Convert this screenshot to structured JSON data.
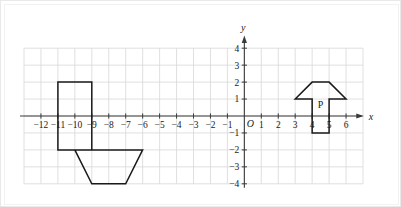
{
  "chart_data": {
    "type": "scatter",
    "title": "",
    "xlabel": "x",
    "ylabel": "y",
    "xlim": [
      -13,
      7
    ],
    "ylim": [
      -4.5,
      4.5
    ],
    "grid": true,
    "legend": null,
    "origin_label": "O",
    "x_ticks": [
      {
        "value": -12,
        "label": "−12"
      },
      {
        "value": -11,
        "label": "−11"
      },
      {
        "value": -10,
        "label": "−10"
      },
      {
        "value": -9,
        "label": "−9"
      },
      {
        "value": -8,
        "label": "−8"
      },
      {
        "value": -7,
        "label": "−7"
      },
      {
        "value": -6,
        "label": "−6"
      },
      {
        "value": -5,
        "label": "−5"
      },
      {
        "value": -4,
        "label": "−4"
      },
      {
        "value": -3,
        "label": "−3"
      },
      {
        "value": -2,
        "label": "−2"
      },
      {
        "value": -1,
        "label": "−1"
      },
      {
        "value": 1,
        "label": "1"
      },
      {
        "value": 2,
        "label": "2"
      },
      {
        "value": 3,
        "label": "3"
      },
      {
        "value": 4,
        "label": "4"
      },
      {
        "value": 5,
        "label": "5"
      },
      {
        "value": 6,
        "label": "6"
      }
    ],
    "y_ticks": [
      {
        "value": 4,
        "label": "4"
      },
      {
        "value": 3,
        "label": "3"
      },
      {
        "value": 2,
        "label": "2"
      },
      {
        "value": 1,
        "label": "1"
      },
      {
        "value": -1,
        "label": "−1"
      },
      {
        "value": -2,
        "label": "−2"
      },
      {
        "value": -3,
        "label": "−3"
      },
      {
        "value": -4,
        "label": "−4"
      }
    ],
    "shapes": [
      {
        "name": "arrow-p",
        "label": "P",
        "label_position": [
          4.5,
          0.45
        ],
        "direction": "up",
        "stroke": "#1a1a1a",
        "fill": "none",
        "vertices": [
          [
            3,
            1
          ],
          [
            4,
            2
          ],
          [
            5,
            2
          ],
          [
            6,
            1
          ],
          [
            5,
            1
          ],
          [
            5,
            -1
          ],
          [
            4,
            -1
          ],
          [
            4,
            1
          ]
        ]
      },
      {
        "name": "arrow-image",
        "label": "",
        "label_position": null,
        "direction": "down",
        "stroke": "#1a1a1a",
        "fill": "none",
        "vertices": [
          [
            -6,
            -2
          ],
          [
            -7,
            -4
          ],
          [
            -9,
            -4
          ],
          [
            -10,
            -2
          ],
          [
            -9,
            -2
          ],
          [
            -9,
            2
          ],
          [
            -11,
            2
          ],
          [
            -11,
            -2
          ]
        ]
      }
    ]
  },
  "axes": {
    "x_axis_name": "x",
    "y_axis_name": "y"
  },
  "colors": {
    "grid": "#d8d8d8",
    "axis": "#3a3a3a",
    "shape_stroke": "#1a1a1a",
    "background": "#ffffff",
    "frame": "#f2f2f2"
  }
}
